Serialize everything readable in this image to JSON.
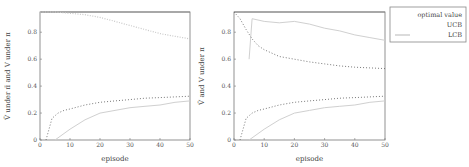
{
  "chart_data": [
    {
      "type": "line",
      "panel": "left",
      "xlabel": "episode",
      "ylabel": "V̄ under π̄ and V under π",
      "xlim": [
        0,
        50
      ],
      "ylim": [
        0,
        0.95
      ],
      "xticks": [
        "0",
        "10",
        "20",
        "30",
        "40",
        "50"
      ],
      "yticks": [
        "0",
        "0.2",
        "0.4",
        "0.6",
        "0.8"
      ],
      "grid": false,
      "series": [
        {
          "name": "optimal value",
          "style": "solid",
          "color": "#888888",
          "x": [
            0,
            50
          ],
          "values": [
            0.95,
            0.95
          ]
        },
        {
          "name": "UCB",
          "style": "dotted",
          "color": "#c8c8c8",
          "x": [
            0,
            5,
            10,
            15,
            20,
            25,
            30,
            35,
            40,
            45,
            50
          ],
          "values": [
            0.95,
            0.95,
            0.94,
            0.93,
            0.91,
            0.88,
            0.85,
            0.82,
            0.79,
            0.77,
            0.75
          ]
        },
        {
          "name": "LCB",
          "style": "dotted-marker",
          "color": "#6a6a6a",
          "x": [
            2,
            4,
            6,
            8,
            10,
            15,
            20,
            25,
            30,
            35,
            40,
            45,
            50
          ],
          "values": [
            0.0,
            0.16,
            0.2,
            0.22,
            0.23,
            0.26,
            0.28,
            0.29,
            0.3,
            0.31,
            0.315,
            0.32,
            0.325
          ]
        },
        {
          "name": "LCB (lower)",
          "style": "faint",
          "color": "#d0d0d0",
          "x": [
            5,
            10,
            15,
            20,
            25,
            30,
            35,
            40,
            45,
            50
          ],
          "values": [
            0.0,
            0.08,
            0.15,
            0.2,
            0.22,
            0.24,
            0.25,
            0.26,
            0.28,
            0.29
          ]
        }
      ]
    },
    {
      "type": "line",
      "panel": "right",
      "xlabel": "episode",
      "ylabel": "V̄ and V under π",
      "xlim": [
        0,
        50
      ],
      "ylim": [
        0,
        0.95
      ],
      "xticks": [
        "0",
        "10",
        "20",
        "30",
        "40",
        "50"
      ],
      "yticks": [
        "0",
        "0.2",
        "0.4",
        "0.6",
        "0.8"
      ],
      "grid": false,
      "series": [
        {
          "name": "optimal value",
          "style": "solid",
          "color": "#888888",
          "x": [
            0,
            50
          ],
          "values": [
            0.95,
            0.95
          ]
        },
        {
          "name": "UCB",
          "style": "faint",
          "color": "#d0d0d0",
          "x": [
            5,
            6,
            10,
            15,
            20,
            25,
            30,
            35,
            40,
            45,
            50
          ],
          "values": [
            0.6,
            0.9,
            0.88,
            0.87,
            0.88,
            0.86,
            0.83,
            0.81,
            0.78,
            0.76,
            0.74
          ]
        },
        {
          "name": "LCB upper",
          "style": "dotted-marker",
          "color": "#6a6a6a",
          "x": [
            0,
            2,
            4,
            6,
            8,
            10,
            15,
            20,
            25,
            30,
            35,
            40,
            45,
            50
          ],
          "values": [
            0.95,
            0.9,
            0.82,
            0.75,
            0.7,
            0.67,
            0.62,
            0.6,
            0.58,
            0.565,
            0.55,
            0.54,
            0.535,
            0.53
          ]
        },
        {
          "name": "LCB lower",
          "style": "dotted-marker",
          "color": "#6a6a6a",
          "x": [
            2,
            4,
            6,
            8,
            10,
            15,
            20,
            25,
            30,
            35,
            40,
            45,
            50
          ],
          "values": [
            0.0,
            0.16,
            0.2,
            0.22,
            0.23,
            0.26,
            0.28,
            0.29,
            0.3,
            0.31,
            0.315,
            0.32,
            0.325
          ]
        },
        {
          "name": "faint lower",
          "style": "faint",
          "color": "#d0d0d0",
          "x": [
            5,
            10,
            15,
            20,
            25,
            30,
            35,
            40,
            45,
            50
          ],
          "values": [
            0.0,
            0.08,
            0.15,
            0.2,
            0.22,
            0.24,
            0.25,
            0.26,
            0.28,
            0.29
          ]
        }
      ]
    }
  ],
  "legend": {
    "items": [
      {
        "label": "optimal value",
        "style": "faint"
      },
      {
        "label": "UCB",
        "style": "faint"
      },
      {
        "label": "LCB",
        "style": "arrow"
      }
    ]
  }
}
